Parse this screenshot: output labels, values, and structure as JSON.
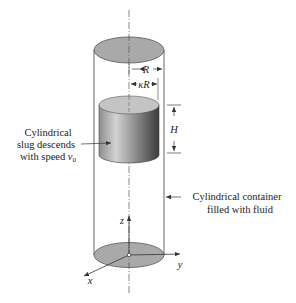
{
  "labels": {
    "slug_line1": "Cylindrical",
    "slug_line2": "slug descends",
    "slug_line3": "with speed ",
    "slug_speed_symbol": "v",
    "slug_speed_subscript": "0",
    "container_line1": "Cylindrical container",
    "container_line2": "filled with fluid",
    "dim_R": "R",
    "dim_kR": "κR",
    "dim_H": "H"
  },
  "axes": {
    "x": "x",
    "y": "y",
    "z": "z"
  },
  "colors": {
    "ellipse_fill": "#a9a9a9",
    "slug_top_fill": "#c4c4c4",
    "slug_light": "#d6d6d6",
    "slug_dark": "#3c3c3c",
    "line": "#333333"
  }
}
